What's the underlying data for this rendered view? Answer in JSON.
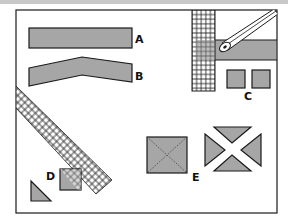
{
  "figure": {
    "labels": {
      "a": "A",
      "b": "B",
      "c": "C",
      "d": "D",
      "e": "E"
    },
    "colors": {
      "fill": "#a6a6a6",
      "stroke": "#1a1a1a",
      "background": "#ffffff",
      "topbar": "#c8c8c8"
    },
    "items": [
      {
        "id": "A",
        "description": "straight horizontal gray bar"
      },
      {
        "id": "B",
        "description": "bent chevron-shaped gray bar"
      },
      {
        "id": "C",
        "description": "two small gray squares below a gray band under a vertical grid and diagonal pen"
      },
      {
        "id": "D",
        "description": "gray square overlapping a diagonal grid band, with a gray right triangle"
      },
      {
        "id": "E",
        "description": "gray square with dashed diagonals and four gray triangles forming an X"
      }
    ]
  }
}
